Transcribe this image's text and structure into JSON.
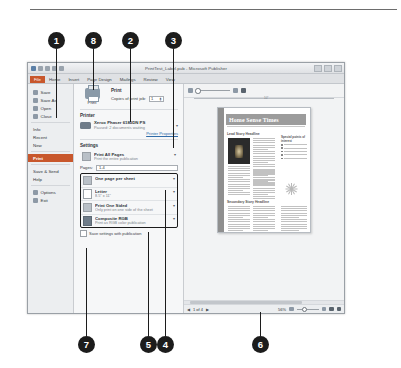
{
  "figure": {
    "callouts": [
      {
        "n": "1",
        "x": 48,
        "y": 32,
        "line_to_y": 118,
        "desc": "backstage-left-nav"
      },
      {
        "n": "8",
        "x": 85,
        "y": 32,
        "line_to_y": 90,
        "desc": "print-button"
      },
      {
        "n": "2",
        "x": 122,
        "y": 32,
        "line_to_y": 122,
        "desc": "printer-selector"
      },
      {
        "n": "3",
        "x": 165,
        "y": 32,
        "line_to_y": 148,
        "desc": "printer-properties-link"
      },
      {
        "n": "7",
        "x": 78,
        "y": 336,
        "line_to_y": 248,
        "desc": "save-settings-checkbox"
      },
      {
        "n": "5",
        "x": 140,
        "y": 336,
        "line_to_y": 232,
        "desc": "color-mode-option"
      },
      {
        "n": "4",
        "x": 157,
        "y": 336,
        "line_to_y": 190,
        "desc": "settings-option-group"
      },
      {
        "n": "6",
        "x": 252,
        "y": 336,
        "line_to_y": 312,
        "desc": "print-preview-pane"
      }
    ]
  },
  "window": {
    "title": "PrintTest_Label.pub - Microsoft Publisher",
    "quick_access": [
      "save-icon",
      "undo-icon",
      "redo-icon",
      "customize-icon"
    ],
    "window_buttons": [
      "minimize-button",
      "restore-button",
      "close-button"
    ],
    "ribbon_tabs": [
      {
        "label": "File",
        "active": true
      },
      {
        "label": "Home",
        "active": false
      },
      {
        "label": "Insert",
        "active": false
      },
      {
        "label": "Page Design",
        "active": false
      },
      {
        "label": "Mailings",
        "active": false
      },
      {
        "label": "Review",
        "active": false
      },
      {
        "label": "View",
        "active": false
      }
    ]
  },
  "backstage_nav": {
    "items": [
      {
        "label": "Save",
        "icon": "save-icon",
        "selected": false
      },
      {
        "label": "Save As",
        "icon": "save-as-icon",
        "selected": false
      },
      {
        "label": "Open",
        "icon": "open-folder-icon",
        "selected": false
      },
      {
        "label": "Close",
        "icon": "close-doc-icon",
        "selected": false
      },
      {
        "label": "Info",
        "icon": "",
        "selected": false
      },
      {
        "label": "Recent",
        "icon": "",
        "selected": false
      },
      {
        "label": "New",
        "icon": "",
        "selected": false
      },
      {
        "label": "Print",
        "icon": "",
        "selected": true
      },
      {
        "label": "Save & Send",
        "icon": "",
        "selected": false
      },
      {
        "label": "Help",
        "icon": "",
        "selected": false
      },
      {
        "label": "Options",
        "icon": "options-icon",
        "selected": false
      },
      {
        "label": "Exit",
        "icon": "exit-icon",
        "selected": false
      }
    ]
  },
  "print_panel": {
    "print_button_label": "Print",
    "print_heading": "Print",
    "copies_label": "Copies of print job:",
    "copies_value": "1",
    "printer_heading": "Printer",
    "printer_name": "Xerox Phaser 6180DN PS",
    "printer_status": "Paused: 2 documents waiting",
    "printer_properties_link": "Printer Properties",
    "settings_heading": "Settings",
    "range_option": {
      "title": "Print All Pages",
      "subtitle": "Print the entire publication",
      "icon": "document-icon"
    },
    "pages_label": "Pages:",
    "pages_value": "1-4",
    "options": [
      {
        "title": "One page per sheet",
        "subtitle": "",
        "icon": "sheet-layout-icon"
      },
      {
        "title": "Letter",
        "subtitle": "8.5\" x 11\"",
        "icon": "paper-size-icon"
      },
      {
        "title": "Print One Sided",
        "subtitle": "Only print on one side of the sheet",
        "icon": "one-sided-icon"
      },
      {
        "title": "Composite RGB",
        "subtitle": "Print as RGB color publication",
        "icon": "color-mode-icon"
      }
    ],
    "save_settings_label": "Save settings with publication"
  },
  "preview": {
    "toolbar_icons": [
      "view-icon",
      "zoom-slider",
      "fit-page-icon",
      "two-page-icon"
    ],
    "ruler_mark": "10\"",
    "page": {
      "newsletter_title": "Home Sense Times",
      "headline_1": "Lead Story Headline",
      "headline_2": "Secondary Story Headline",
      "sidebar_heading": "Special points of interest"
    },
    "status": {
      "page_indicator": "1 of 4",
      "zoom_level": "56%",
      "prev_label": "◀",
      "next_label": "▶"
    }
  },
  "colors": {
    "accent": "#c8572c",
    "callout": "#1c1c1c",
    "link": "#2f6ba8"
  }
}
